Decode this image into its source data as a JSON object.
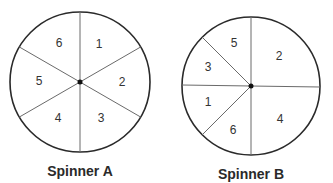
{
  "spinners": [
    {
      "name": "Spinner A",
      "sections": [
        {
          "label": "1",
          "start_deg": 30,
          "end_deg": 90
        },
        {
          "label": "2",
          "start_deg": -30,
          "end_deg": 30
        },
        {
          "label": "3",
          "start_deg": -90,
          "end_deg": -30
        },
        {
          "label": "4",
          "start_deg": -150,
          "end_deg": -90
        },
        {
          "label": "5",
          "start_deg": 150,
          "end_deg": 210
        },
        {
          "label": "6",
          "start_deg": 90,
          "end_deg": 150
        }
      ]
    },
    {
      "name": "Spinner B",
      "sections": [
        {
          "label": "2",
          "start_deg": 0,
          "end_deg": 90
        },
        {
          "label": "4",
          "start_deg": -90,
          "end_deg": 0
        },
        {
          "label": "5",
          "start_deg": 90,
          "end_deg": 135
        },
        {
          "label": "3",
          "start_deg": 135,
          "end_deg": 180
        },
        {
          "label": "1",
          "start_deg": 180,
          "end_deg": 225
        },
        {
          "label": "6",
          "start_deg": 225,
          "end_deg": 270
        }
      ]
    }
  ],
  "labels": {
    "spinner_a": "Spinner A",
    "spinner_b": "Spinner B",
    "a": [
      "1",
      "2",
      "3",
      "4",
      "5",
      "6"
    ],
    "b": [
      "5",
      "2",
      "3",
      "1",
      "6",
      "4"
    ]
  }
}
